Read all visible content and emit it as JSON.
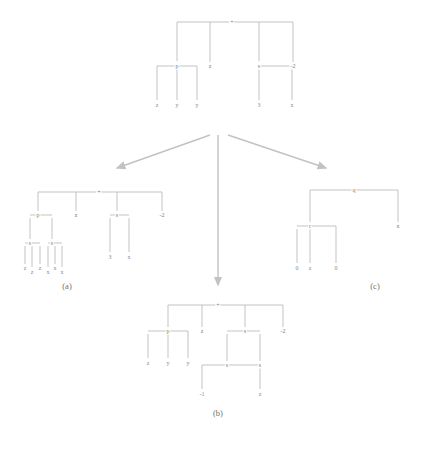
{
  "figure": {
    "line_color": "#b9b9b9",
    "arrow_color": "#bdbdbd",
    "text_color": "#7b7b7b"
  },
  "captions": [
    {
      "id": "cap-a",
      "text": "(a)",
      "x": 67,
      "y": 287
    },
    {
      "id": "cap-b",
      "text": "(b)",
      "x": 218,
      "y": 414
    },
    {
      "id": "cap-c",
      "text": "(c)",
      "x": 375,
      "y": 287
    }
  ],
  "trees": {
    "source": {
      "name": "source-tree",
      "root": {
        "label": "+",
        "x": 232,
        "y": 22
      },
      "nodes": [
        {
          "label": "p",
          "x": 177,
          "y": 66
        },
        {
          "label": "z",
          "x": 210,
          "y": 66
        },
        {
          "label": "s",
          "x": 259,
          "y": 66
        },
        {
          "label": "-2",
          "x": 293,
          "y": 66
        }
      ],
      "leaves": [
        {
          "label": "z",
          "x": 157,
          "y": 104
        },
        {
          "label": "y",
          "x": 177,
          "y": 104
        },
        {
          "label": "y",
          "x": 197,
          "y": 104
        },
        {
          "label": "3",
          "x": 259,
          "y": 104
        },
        {
          "label": "x",
          "x": 292,
          "y": 104
        }
      ]
    },
    "a": {
      "name": "tree-a",
      "root": {
        "label": "+",
        "x": 99,
        "y": 192
      },
      "nodes": [
        {
          "label": "p",
          "x": 38,
          "y": 215
        },
        {
          "label": "z",
          "x": 76,
          "y": 215
        },
        {
          "label": "s",
          "x": 117,
          "y": 215
        },
        {
          "label": "-2",
          "x": 162,
          "y": 215
        },
        {
          "label": "s",
          "x": 30,
          "y": 243
        },
        {
          "label": "s",
          "x": 52,
          "y": 243
        }
      ],
      "leaves": [
        {
          "label": "z",
          "x": 25,
          "y": 268
        },
        {
          "label": "z",
          "x": 32,
          "y": 271
        },
        {
          "label": "z",
          "x": 40,
          "y": 268
        },
        {
          "label": "x",
          "x": 48,
          "y": 271
        },
        {
          "label": "x",
          "x": 55,
          "y": 268
        },
        {
          "label": "x",
          "x": 62,
          "y": 271
        },
        {
          "label": "3",
          "x": 110,
          "y": 256
        },
        {
          "label": "x",
          "x": 129,
          "y": 256
        }
      ]
    },
    "b": {
      "name": "tree-b",
      "root": {
        "label": "+",
        "x": 218,
        "y": 305
      },
      "nodes": [
        {
          "label": "p",
          "x": 168,
          "y": 331
        },
        {
          "label": "z",
          "x": 202,
          "y": 331
        },
        {
          "label": "s",
          "x": 245,
          "y": 331
        },
        {
          "label": "-2",
          "x": 283,
          "y": 331
        },
        {
          "label": "s",
          "x": 227,
          "y": 365
        },
        {
          "label": "s",
          "x": 260,
          "y": 365
        }
      ],
      "leaves": [
        {
          "label": "z",
          "x": 148,
          "y": 362
        },
        {
          "label": "y",
          "x": 168,
          "y": 362
        },
        {
          "label": "y",
          "x": 188,
          "y": 362
        },
        {
          "label": "-1",
          "x": 202,
          "y": 393
        },
        {
          "label": "z",
          "x": 260,
          "y": 393
        }
      ]
    },
    "c": {
      "name": "tree-c",
      "root": {
        "label": "q",
        "x": 354,
        "y": 190
      },
      "nodes": [
        {
          "label": "r",
          "x": 310,
          "y": 226
        },
        {
          "label": "x",
          "x": 398,
          "y": 226
        }
      ],
      "leaves": [
        {
          "label": "0",
          "x": 297,
          "y": 267
        },
        {
          "label": "z",
          "x": 310,
          "y": 267
        },
        {
          "label": "0",
          "x": 336,
          "y": 267
        }
      ]
    }
  },
  "arrows": [
    {
      "name": "arrow-left",
      "x1": 210,
      "y1": 135,
      "x2": 113,
      "y2": 170
    },
    {
      "name": "arrow-middle",
      "x1": 218,
      "y1": 135,
      "x2": 218,
      "y2": 288
    },
    {
      "name": "arrow-right",
      "x1": 228,
      "y1": 135,
      "x2": 330,
      "y2": 170
    }
  ]
}
